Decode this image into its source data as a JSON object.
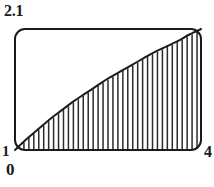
{
  "figure": {
    "title": "",
    "background_color": "#ffffff",
    "line_color": "#1a1a1a",
    "hatch_color": "#2b2b2b"
  },
  "labels": {
    "y_max": "2.1",
    "y_min": "1",
    "x_min": "0",
    "x_max": "4"
  },
  "chart_data": {
    "type": "area",
    "title": "",
    "xlabel": "",
    "ylabel": "",
    "xlim": [
      0,
      4
    ],
    "ylim": [
      1,
      2.1
    ],
    "grid": false,
    "legend": null,
    "fill_style": "vertical-hatch",
    "hatch_line_count": 37,
    "frame": {
      "style": "rounded-rectangle",
      "corner_radius_px": 10,
      "left_px": 15,
      "right_px": 201,
      "top_px": 29,
      "bottom_px": 150
    },
    "series": [
      {
        "name": "curve",
        "shape": "increasing-concave-down",
        "x": [
          0.0,
          0.25,
          0.5,
          0.75,
          1.0,
          1.25,
          1.5,
          1.75,
          2.0,
          2.25,
          2.5,
          2.75,
          3.0,
          3.25,
          3.5,
          3.75,
          4.0
        ],
        "y": [
          1.0,
          1.1,
          1.19,
          1.28,
          1.36,
          1.44,
          1.51,
          1.58,
          1.65,
          1.71,
          1.77,
          1.83,
          1.89,
          1.94,
          1.99,
          2.05,
          2.1
        ]
      }
    ],
    "tick_labels": {
      "x": [
        "0",
        "4"
      ],
      "y": [
        "1",
        "2.1"
      ]
    }
  }
}
